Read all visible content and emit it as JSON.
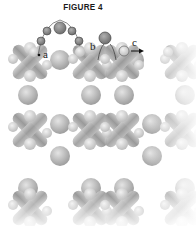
{
  "figure": {
    "title": "FIGURE 4",
    "labels": {
      "a": "a",
      "b": "b",
      "c": "c"
    }
  },
  "colors": {
    "large_sphere": "#b8b8b8",
    "small_sphere": "#d6d6d6",
    "rod": "#a9a9a9",
    "adsorbate": "#8a8a8a",
    "outline": "#555555"
  }
}
